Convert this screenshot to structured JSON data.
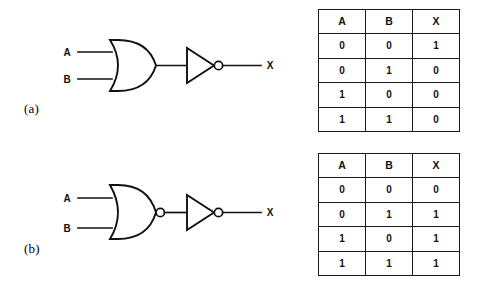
{
  "figure": {
    "background": "#ffffff",
    "ink": "#111111",
    "panels": [
      {
        "id": "a",
        "label": "(a)",
        "circuit": {
          "name": "nor-equivalent-or-then-inverter",
          "inputs": [
            {
              "name": "input-a",
              "label": "A"
            },
            {
              "name": "input-b",
              "label": "B"
            }
          ],
          "output": {
            "name": "output-x",
            "label": "X"
          },
          "gates": [
            {
              "name": "or-gate",
              "type": "OR",
              "bubble": false
            },
            {
              "name": "inverter-gate",
              "type": "NOT",
              "bubble": true
            }
          ]
        },
        "table": {
          "name": "truth-table-a",
          "headers": [
            "A",
            "B",
            "X"
          ],
          "rows": [
            [
              "0",
              "0",
              "1"
            ],
            [
              "0",
              "1",
              "0"
            ],
            [
              "1",
              "0",
              "0"
            ],
            [
              "1",
              "1",
              "0"
            ]
          ]
        }
      },
      {
        "id": "b",
        "label": "(b)",
        "circuit": {
          "name": "or-equivalent-nor-then-inverter",
          "inputs": [
            {
              "name": "input-a",
              "label": "A"
            },
            {
              "name": "input-b",
              "label": "B"
            }
          ],
          "output": {
            "name": "output-x",
            "label": "X"
          },
          "gates": [
            {
              "name": "nor-gate",
              "type": "NOR",
              "bubble": true
            },
            {
              "name": "inverter-gate",
              "type": "NOT",
              "bubble": true
            }
          ]
        },
        "table": {
          "name": "truth-table-b",
          "headers": [
            "A",
            "B",
            "X"
          ],
          "rows": [
            [
              "0",
              "0",
              "0"
            ],
            [
              "0",
              "1",
              "1"
            ],
            [
              "1",
              "0",
              "1"
            ],
            [
              "1",
              "1",
              "1"
            ]
          ]
        }
      }
    ]
  }
}
